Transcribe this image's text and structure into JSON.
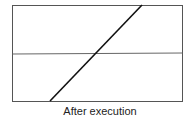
{
  "diagram": {
    "caption": "After execution",
    "frame": {
      "x1": 12.5,
      "y1": 5.5,
      "x2": 182.5,
      "y2": 101.5,
      "stroke": "#555555"
    },
    "horizontal_line": {
      "x1": 12.5,
      "y1": 54,
      "x2": 182.5,
      "y2": 53,
      "stroke": "#666666"
    },
    "diagonal_line": {
      "x1": 50,
      "y1": 101,
      "x2": 142,
      "y2": 5,
      "stroke": "#111111"
    }
  }
}
